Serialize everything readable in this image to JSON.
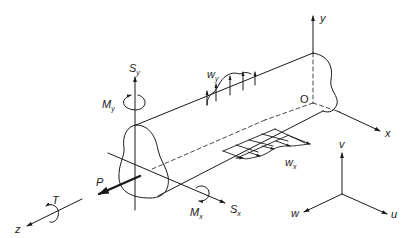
{
  "figure": {
    "type": "beam free-body diagram",
    "labels": {
      "y_axis": "y",
      "x_axis": "x",
      "z_axis": "z",
      "origin": "O",
      "shear_y": {
        "main": "S",
        "sub": "y"
      },
      "shear_x": {
        "main": "S",
        "sub": "x"
      },
      "moment_y": {
        "main": "M",
        "sub": "y"
      },
      "moment_x": {
        "main": "M",
        "sub": "x"
      },
      "torque": "T",
      "axial_load": "P",
      "dist_load_y": {
        "main": "w",
        "sub": "y"
      },
      "dist_load_x": {
        "main": "w",
        "sub": "x"
      },
      "disp_v": "v",
      "disp_u": "u",
      "disp_w": "w"
    },
    "colors": {
      "ink": "#1a1a1a",
      "background": "#ffffff"
    }
  }
}
